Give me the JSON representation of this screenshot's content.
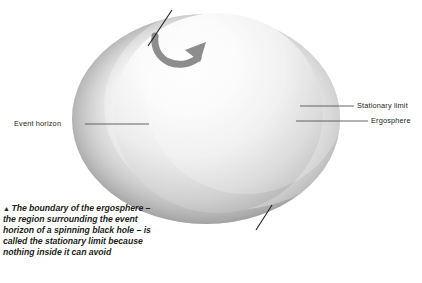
{
  "figure": {
    "type": "astronomy-diagram",
    "labels": {
      "event_horizon": "Event horizon",
      "stationary_limit": "Stationary limit",
      "ergosphere": "Ergosphere"
    },
    "caption": {
      "marker": "▲",
      "text": "The boundary of the ergosphere – the region surrounding the event horizon of a spinning black hole – is called the stationary limit because nothing inside it can avoid"
    },
    "annotations": {
      "spin_arrow": "rotation-arrow",
      "pointer_top": "pointer-line-top",
      "pointer_bottom": "pointer-line-bottom"
    },
    "colors": {
      "background": "#ffffff",
      "text": "#231f20",
      "leader_line": "#4a4a4a",
      "spin_arrow": "#8c8c8c",
      "ergosphere_light": "#f3f3f3",
      "ergosphere_mid": "#cfcfcf",
      "ergosphere_dark": "#9a9a9a",
      "horizon_light": "#ffffff",
      "horizon_mid": "#e2e2e2",
      "horizon_dark": "#9b9b9b"
    }
  }
}
